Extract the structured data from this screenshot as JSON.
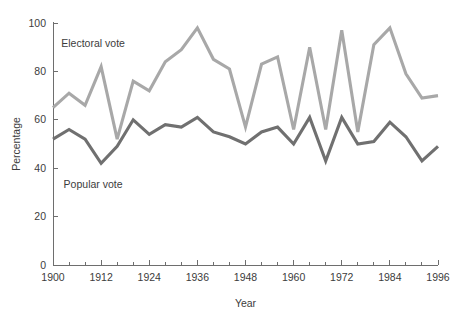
{
  "chart_data": {
    "type": "line",
    "title": "",
    "xlabel": "Year",
    "ylabel": "Percentage",
    "xlim": [
      1900,
      1996
    ],
    "ylim": [
      0,
      100
    ],
    "grid": false,
    "legend_position": "inline-annotation",
    "x_tick_labels": [
      "1900",
      "1912",
      "1924",
      "1936",
      "1948",
      "1960",
      "1972",
      "1984",
      "1996"
    ],
    "x_tick_values": [
      1900,
      1912,
      1924,
      1936,
      1948,
      1960,
      1972,
      1984,
      1996
    ],
    "x_minor_tick_values": [
      1904,
      1908,
      1916,
      1920,
      1928,
      1932,
      1940,
      1944,
      1952,
      1956,
      1964,
      1968,
      1976,
      1980,
      1988,
      1992
    ],
    "y_tick_labels": [
      "0",
      "20",
      "40",
      "60",
      "80",
      "100"
    ],
    "y_tick_values": [
      0,
      20,
      40,
      60,
      80,
      100
    ],
    "x": [
      1900,
      1904,
      1908,
      1912,
      1916,
      1920,
      1924,
      1928,
      1932,
      1936,
      1940,
      1944,
      1948,
      1952,
      1956,
      1960,
      1964,
      1968,
      1972,
      1976,
      1980,
      1984,
      1988,
      1992,
      1996
    ],
    "series": [
      {
        "name": "Electoral vote",
        "color": "#a8a8a8",
        "values": [
          65,
          71,
          66,
          82,
          52,
          76,
          72,
          84,
          89,
          98,
          85,
          81,
          57,
          83,
          86,
          56,
          90,
          56,
          97,
          55,
          91,
          98,
          79,
          69,
          70
        ]
      },
      {
        "name": "Popular vote",
        "color": "#707070",
        "values": [
          52,
          56,
          52,
          42,
          49,
          60,
          54,
          58,
          57,
          61,
          55,
          53,
          50,
          55,
          57,
          50,
          61,
          43,
          61,
          50,
          51,
          59,
          53,
          43,
          49
        ]
      }
    ],
    "annotations": [
      {
        "text": "Electoral vote",
        "x": 1910,
        "y": 90,
        "series": "Electoral vote"
      },
      {
        "text": "Popular vote",
        "x": 1910,
        "y": 32,
        "series": "Popular vote"
      }
    ]
  },
  "axes": {
    "y_axis_title": "Percentage",
    "x_axis_title": "Year"
  },
  "colors": {
    "electoral": "#a8a8a8",
    "popular": "#707070",
    "axis": "#6e6e6e",
    "text": "#3c3c3c",
    "background": "#ffffff"
  }
}
